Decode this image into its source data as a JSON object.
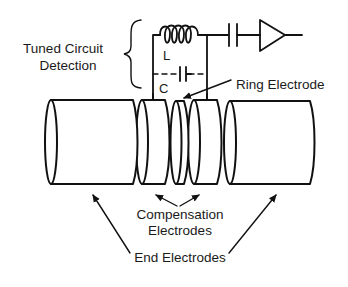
{
  "figure": {
    "labels": {
      "tuned_circuit_line1": "Tuned Circuit",
      "tuned_circuit_line2": "Detection",
      "inductor": "L",
      "capacitor": "C",
      "ring_electrode": "Ring Electrode",
      "compensation_line1": "Compensation",
      "compensation_line2": "Electrodes",
      "end_electrodes": "End Electrodes"
    },
    "components": [
      {
        "id": "end-electrode-left",
        "type": "cylinder"
      },
      {
        "id": "compensation-electrode-left",
        "type": "cylinder"
      },
      {
        "id": "ring-electrode",
        "type": "cylinder"
      },
      {
        "id": "compensation-electrode-right",
        "type": "cylinder"
      },
      {
        "id": "end-electrode-right",
        "type": "cylinder"
      },
      {
        "id": "inductor",
        "type": "coil",
        "label": "L"
      },
      {
        "id": "tuning-capacitor",
        "type": "capacitor",
        "label": "C"
      },
      {
        "id": "coupling-capacitor",
        "type": "capacitor"
      },
      {
        "id": "amplifier",
        "type": "triangle"
      }
    ],
    "colors": {
      "line": "#111111",
      "background": "#ffffff"
    }
  }
}
